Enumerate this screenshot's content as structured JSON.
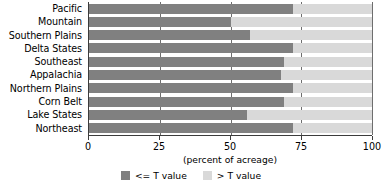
{
  "chart_data": {
    "type": "bar",
    "orientation": "horizontal",
    "stacked": true,
    "title": "",
    "xlabel": "(percent of acreage)",
    "ylabel": "",
    "xlim": [
      0,
      100
    ],
    "xticks": [
      0,
      25,
      50,
      75,
      100
    ],
    "xticklabels": [
      "0",
      "25",
      "50",
      "75",
      "100"
    ],
    "grid": true,
    "grid_axis": "x",
    "legend_position": "bottom-center",
    "categories": [
      "Pacific",
      "Mountain",
      "Southern Plains",
      "Delta States",
      "Southeast",
      "Appalachia",
      "Northern Plains",
      "Corn Belt",
      "Lake States",
      "Northeast"
    ],
    "series": [
      {
        "name": "<= T value",
        "color": "#808080",
        "values": [
          72,
          50,
          57,
          72,
          69,
          68,
          72,
          69,
          56,
          72
        ]
      },
      {
        "name": "> T value",
        "color": "#d9d9d9",
        "values": [
          28,
          50,
          43,
          28,
          31,
          32,
          28,
          31,
          44,
          28
        ]
      }
    ]
  },
  "legend": {
    "items": [
      {
        "label": "<= T value",
        "swatch": "low"
      },
      {
        "label": "> T value",
        "swatch": "high"
      }
    ]
  },
  "colors": {
    "series_low": "#808080",
    "series_high": "#d9d9d9",
    "axis": "#3c3c3c",
    "gridline": "#6e6e6e",
    "background": "#ffffff"
  }
}
